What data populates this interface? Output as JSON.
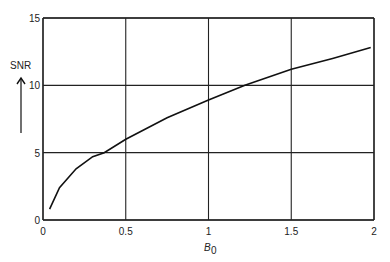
{
  "chart_data": {
    "type": "line",
    "title": "",
    "xlabel": "B0",
    "ylabel": "SNR",
    "xlim": [
      0,
      2
    ],
    "ylim": [
      0,
      15
    ],
    "xticks": [
      "0",
      "0.5",
      "1",
      "1.5",
      "2"
    ],
    "yticks": [
      "0",
      "5",
      "10",
      "15"
    ],
    "grid": true,
    "legend": null,
    "series": [
      {
        "name": "SNR",
        "x": [
          0.04,
          0.1,
          0.2,
          0.3,
          0.37,
          0.5,
          0.75,
          1.0,
          1.22,
          1.5,
          1.75,
          1.98
        ],
        "y": [
          0.8,
          2.4,
          3.8,
          4.7,
          5.0,
          6.0,
          7.6,
          8.9,
          10.0,
          11.2,
          12.0,
          12.8
        ]
      }
    ]
  },
  "axes": {
    "x_label_main": "B",
    "x_label_sub": "0",
    "y_label": "SNR"
  }
}
